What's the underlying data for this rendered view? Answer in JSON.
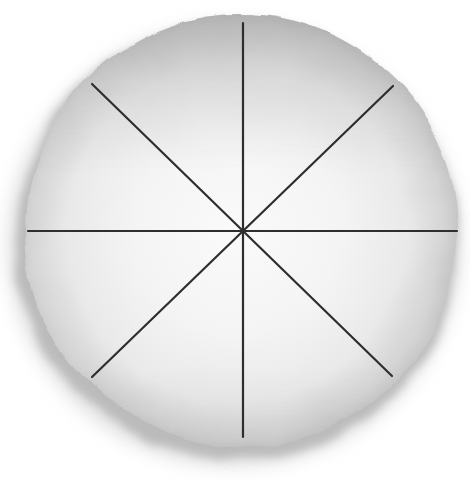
{
  "diagram": {
    "type": "pie-circle-divided-into-eighths",
    "divisions": 8,
    "canvas": {
      "width": 470,
      "height": 481
    },
    "pie": {
      "cx": 241,
      "cy": 231,
      "r": 216
    },
    "shadow": {
      "cx": 237,
      "cy": 241,
      "rx": 221,
      "ry": 219
    },
    "shadow_outer": {
      "cx": 234,
      "cy": 245,
      "rx": 226,
      "ry": 221
    },
    "division_lines": [
      {
        "name": "vertical",
        "x1": 243,
        "y1": 23,
        "x2": 243,
        "y2": 437
      },
      {
        "name": "horizontal",
        "x1": 28,
        "y1": 231,
        "x2": 457,
        "y2": 231
      },
      {
        "name": "diagonal-nw-se",
        "x1": 92,
        "y1": 84,
        "x2": 392,
        "y2": 376
      },
      {
        "name": "diagonal-ne-sw",
        "x1": 393,
        "y1": 86,
        "x2": 92,
        "y2": 377
      }
    ],
    "line_width": 2.2,
    "colors": {
      "background": "#ffffff",
      "line": "#2e2e2e",
      "surface_center": "#fafafa",
      "surface_inner": "#f4f4f4",
      "surface_outer": "#e9e9e9",
      "rim": "#d4d4d4",
      "rim_dark": "#bdbdbd",
      "top_shade": "#8f8f8f",
      "shadow": "#a3a3a3",
      "shadow_soft": "#c6c6c6"
    }
  }
}
